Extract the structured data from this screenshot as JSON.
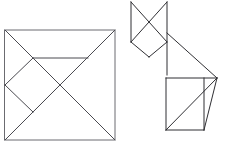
{
  "figure": {
    "caption": "",
    "stroke_color": "#2f2f33",
    "light_stroke_color": "#6b6b70",
    "background_color": "#ffffff",
    "width": 229,
    "height": 147
  },
  "shapes": {
    "square": {
      "label": "tangram-square",
      "outline": "5,30 115,30 115,140 5,140",
      "pieces": [
        {
          "name": "large-triangle-left",
          "points": "5,30 60,85 5,140"
        },
        {
          "name": "large-triangle-top",
          "points": "5,30 115,30 60,85"
        },
        {
          "name": "medium-triangle-bottom-right",
          "points": "115,30 115,140 5,140"
        },
        {
          "name": "small-triangle-upper",
          "points": "33,58 88,58 60,85"
        },
        {
          "name": "square-piece",
          "points": "33,58 60,85 33,112 5,85"
        },
        {
          "name": "parallelogram-piece",
          "points": "33,112 60,85 88,58 115,30"
        },
        {
          "name": "diagonal-main",
          "points": "5,140 115,30"
        }
      ]
    },
    "cat": {
      "label": "tangram-cat",
      "head": {
        "left_ear": "131,2 152,30 131,42",
        "right_ear": "167,2 152,30 167,42",
        "left_vertical": "131,2 131,42",
        "right_vertical": "167,2 167,75",
        "diamond_left": "131,42 149,57",
        "diamond_right": "149,57 167,42",
        "cross_left": "131,2 167,42",
        "cross_right": "167,2 131,42"
      },
      "body": {
        "neck_diagonal": "167,33 217,78",
        "top_edge": "166,78 217,78",
        "left_side": "166,78 166,130",
        "bottom_edge": "166,130 204,130",
        "inner_vertical": "204,78 204,130",
        "inner_diagonal": "166,130 217,78",
        "right_slant": "217,78 204,130"
      }
    }
  }
}
